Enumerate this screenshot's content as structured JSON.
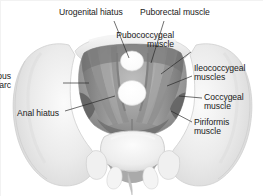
{
  "figure": {
    "kind": "anatomical-illustration",
    "background_color": "#ffffff",
    "border_color": "#f2f2f2",
    "label_color": "#1a1a1a",
    "leader_color": "#222222",
    "bone_color": "#efefef",
    "muscle_color": "#9a9a9a",
    "muscle_dark_color": "#6d6d6d",
    "hiatus_color": "#ffffff"
  },
  "labels": [
    {
      "id": "urogenital-hiatus",
      "text": "Urogenital hiatus",
      "align": "center",
      "x": 58,
      "y": 7
    },
    {
      "id": "puborectal-muscle",
      "text": "Puborectal muscle",
      "align": "left",
      "x": 139,
      "y": 7
    },
    {
      "id": "pubococcygeal",
      "text": "Pubococcygeal\nmuscle",
      "align": "right",
      "x": 175,
      "y": 30
    },
    {
      "id": "ileococcygeal",
      "text": "Ileococcygeal\nmuscles",
      "align": "left",
      "x": 193,
      "y": 63
    },
    {
      "id": "coccygeal-muscle",
      "text": "Coccygeal\nmuscle",
      "align": "left",
      "x": 203,
      "y": 92
    },
    {
      "id": "piriformis-muscle",
      "text": "Piriformis\nmuscle",
      "align": "left",
      "x": 193,
      "y": 117
    },
    {
      "id": "tendinous-arc",
      "text": "Tendinous\narc",
      "align": "right",
      "x": 12,
      "y": 71
    },
    {
      "id": "anal-hiatus",
      "text": "Anal hiatus",
      "align": "left",
      "x": 16,
      "y": 108
    }
  ],
  "leader_lines": [
    {
      "id": "leader-urogenital-hiatus",
      "x1": 113,
      "y1": 20,
      "x2": 128,
      "y2": 57
    },
    {
      "id": "leader-puborectal",
      "x1": 163,
      "y1": 20,
      "x2": 150,
      "y2": 62
    },
    {
      "id": "leader-pubococcygeal",
      "x1": 190,
      "y1": 51,
      "x2": 160,
      "y2": 73
    },
    {
      "id": "leader-ileococcygeal",
      "x1": 191,
      "y1": 75,
      "x2": 166,
      "y2": 85
    },
    {
      "id": "leader-coccygeal",
      "x1": 201,
      "y1": 97,
      "x2": 178,
      "y2": 95
    },
    {
      "id": "leader-piriformis",
      "x1": 191,
      "y1": 121,
      "x2": 170,
      "y2": 110
    },
    {
      "id": "leader-tendinous-arc",
      "x1": 62,
      "y1": 82,
      "x2": 88,
      "y2": 82
    },
    {
      "id": "leader-anal-hiatus",
      "x1": 64,
      "y1": 110,
      "x2": 114,
      "y2": 95
    }
  ]
}
